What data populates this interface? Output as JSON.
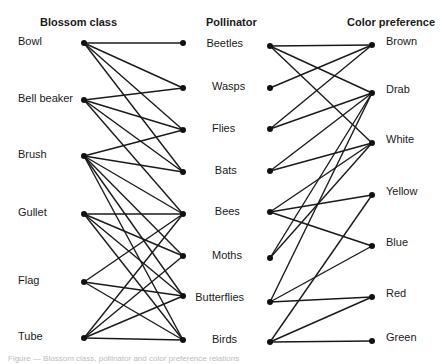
{
  "headers": {
    "left": "Blossom class",
    "middle": "Pollinator",
    "right": "Color preference"
  },
  "blossom_classes": [
    {
      "label": "Bowl",
      "y": 43
    },
    {
      "label": "Bell beaker",
      "y": 100
    },
    {
      "label": "Brush",
      "y": 156
    },
    {
      "label": "Gullet",
      "y": 214
    },
    {
      "label": "Flag",
      "y": 282
    },
    {
      "label": "Tube",
      "y": 338
    }
  ],
  "pollinators": [
    {
      "label": "Beetles",
      "yl": 43,
      "yr": 46
    },
    {
      "label": "Wasps",
      "yl": 88,
      "yr": 88
    },
    {
      "label": "Flies",
      "yl": 130,
      "yr": 129
    },
    {
      "label": "Bats",
      "yl": 172,
      "yr": 171
    },
    {
      "label": "Bees",
      "yl": 214,
      "yr": 212
    },
    {
      "label": "Moths",
      "yl": 256,
      "yr": 258
    },
    {
      "label": "Butterflies",
      "yl": 296,
      "yr": 302
    },
    {
      "label": "Birds",
      "yl": 340,
      "yr": 342
    }
  ],
  "colors": [
    {
      "label": "Brown",
      "y": 45
    },
    {
      "label": "Drab",
      "y": 93
    },
    {
      "label": "White",
      "y": 143
    },
    {
      "label": "Yellow",
      "y": 195
    },
    {
      "label": "Blue",
      "y": 246
    },
    {
      "label": "Red",
      "y": 297
    },
    {
      "label": "Green",
      "y": 341
    }
  ],
  "blossom_pollinator_links": [
    [
      "Bowl",
      "Beetles"
    ],
    [
      "Bowl",
      "Wasps"
    ],
    [
      "Bowl",
      "Flies"
    ],
    [
      "Bowl",
      "Bats"
    ],
    [
      "Bell beaker",
      "Wasps"
    ],
    [
      "Bell beaker",
      "Flies"
    ],
    [
      "Bell beaker",
      "Bats"
    ],
    [
      "Bell beaker",
      "Bees"
    ],
    [
      "Brush",
      "Flies"
    ],
    [
      "Brush",
      "Bats"
    ],
    [
      "Brush",
      "Bees"
    ],
    [
      "Brush",
      "Moths"
    ],
    [
      "Brush",
      "Butterflies"
    ],
    [
      "Brush",
      "Birds"
    ],
    [
      "Gullet",
      "Bees"
    ],
    [
      "Gullet",
      "Moths"
    ],
    [
      "Gullet",
      "Butterflies"
    ],
    [
      "Gullet",
      "Birds"
    ],
    [
      "Flag",
      "Bees"
    ],
    [
      "Flag",
      "Butterflies"
    ],
    [
      "Flag",
      "Birds"
    ],
    [
      "Tube",
      "Bees"
    ],
    [
      "Tube",
      "Moths"
    ],
    [
      "Tube",
      "Butterflies"
    ],
    [
      "Tube",
      "Birds"
    ]
  ],
  "pollinator_color_links": [
    [
      "Beetles",
      "Brown"
    ],
    [
      "Beetles",
      "Drab"
    ],
    [
      "Beetles",
      "White"
    ],
    [
      "Wasps",
      "Brown"
    ],
    [
      "Flies",
      "Brown"
    ],
    [
      "Flies",
      "Drab"
    ],
    [
      "Bats",
      "Drab"
    ],
    [
      "Bats",
      "White"
    ],
    [
      "Bees",
      "White"
    ],
    [
      "Bees",
      "Yellow"
    ],
    [
      "Bees",
      "Blue"
    ],
    [
      "Moths",
      "Drab"
    ],
    [
      "Moths",
      "White"
    ],
    [
      "Butterflies",
      "Drab"
    ],
    [
      "Butterflies",
      "Blue"
    ],
    [
      "Butterflies",
      "Red"
    ],
    [
      "Birds",
      "Yellow"
    ],
    [
      "Birds",
      "Red"
    ],
    [
      "Birds",
      "Green"
    ]
  ],
  "caption": "Figure — Blossom class, pollinator and color preference relations"
}
